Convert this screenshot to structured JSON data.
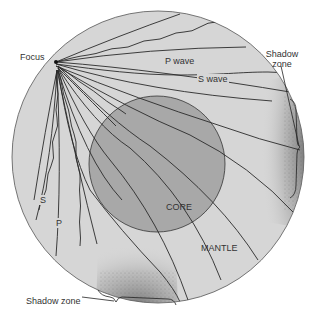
{
  "diagram": {
    "labels": {
      "focus": "Focus",
      "p_wave": "P wave",
      "s_wave": "S wave",
      "shadow_zone_right_line1": "Shadow",
      "shadow_zone_right_line2": "zone",
      "shadow_zone_bottom": "Shadow zone",
      "core": "CORE",
      "mantle": "MANTLE",
      "s_short": "S",
      "p_short": "P"
    },
    "colors": {
      "mantle_fill": "#d6d6d6",
      "core_fill": "#a8a8a8",
      "line": "#2a2a2a",
      "outline": "#555555",
      "shadow_stipple": "#6a6a6a"
    },
    "geometry": {
      "earth_center": [
        158,
        157
      ],
      "earth_radius": 146,
      "core_center": [
        157,
        164
      ],
      "core_radius": 68,
      "focus_point": [
        56,
        62
      ]
    }
  }
}
